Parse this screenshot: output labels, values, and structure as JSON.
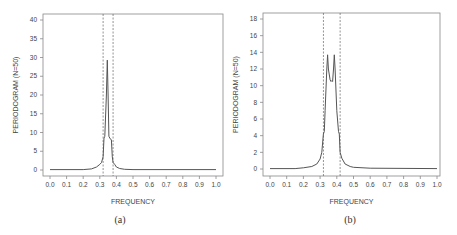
{
  "chart_data": [
    {
      "type": "line",
      "panel": "a",
      "caption": "(a)",
      "xlabel": "FREQUENCY",
      "ylabel": "PERIODOGRAM (N=50)",
      "xlim": [
        0.0,
        1.0
      ],
      "ylim": [
        0,
        40
      ],
      "xticks": [
        "0.0",
        "0.1",
        "0.2",
        "0.3",
        "0.4",
        "0.5",
        "0.6",
        "0.7",
        "0.8",
        "0.9",
        "1.0"
      ],
      "yticks": [
        "0",
        "5",
        "10",
        "15",
        "20",
        "25",
        "30",
        "35",
        "40"
      ],
      "grid": false,
      "vlines": [
        0.32,
        0.38
      ],
      "x": [
        0.0,
        0.2,
        0.25,
        0.28,
        0.3,
        0.31,
        0.32,
        0.325,
        0.33,
        0.34,
        0.345,
        0.35,
        0.355,
        0.36,
        0.37,
        0.375,
        0.38,
        0.39,
        0.4,
        0.42,
        0.45,
        0.5,
        1.0
      ],
      "values": [
        0.1,
        0.1,
        0.3,
        0.8,
        1.5,
        2.0,
        3.5,
        8.5,
        9.0,
        20.0,
        29.3,
        20.0,
        9.0,
        8.5,
        8.0,
        3.5,
        2.0,
        1.5,
        0.8,
        0.4,
        0.2,
        0.1,
        0.1
      ]
    },
    {
      "type": "line",
      "panel": "b",
      "caption": "(b)",
      "xlabel": "FREQUENCY",
      "ylabel": "PERIODOGRAM (N=50)",
      "xlim": [
        0.0,
        1.0
      ],
      "ylim": [
        0,
        18
      ],
      "xticks": [
        "0.0",
        "0.1",
        "0.2",
        "0.3",
        "0.4",
        "0.5",
        "0.6",
        "0.7",
        "0.8",
        "0.9",
        "1.0"
      ],
      "yticks": [
        "0",
        "2",
        "4",
        "6",
        "8",
        "10",
        "12",
        "14",
        "16",
        "18"
      ],
      "grid": false,
      "vlines": [
        0.32,
        0.42
      ],
      "x": [
        0.0,
        0.15,
        0.2,
        0.25,
        0.28,
        0.3,
        0.31,
        0.32,
        0.325,
        0.33,
        0.34,
        0.345,
        0.35,
        0.36,
        0.365,
        0.37,
        0.375,
        0.38,
        0.385,
        0.39,
        0.4,
        0.41,
        0.415,
        0.42,
        0.43,
        0.45,
        0.48,
        0.5,
        0.6,
        1.0
      ],
      "values": [
        0.05,
        0.05,
        0.15,
        0.3,
        0.6,
        1.2,
        2.0,
        4.2,
        4.5,
        7.0,
        12.0,
        13.7,
        12.0,
        10.7,
        10.5,
        10.6,
        10.5,
        12.0,
        13.7,
        12.0,
        7.0,
        4.5,
        4.2,
        2.0,
        1.3,
        0.6,
        0.3,
        0.2,
        0.1,
        0.05
      ]
    }
  ]
}
